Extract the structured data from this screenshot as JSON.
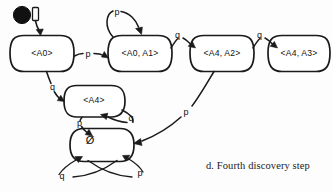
{
  "figure": {
    "caption": "d. Fourth discovery step",
    "kind": "finite-automaton-diagram",
    "background_color": "#fdfdfd",
    "ink_color": "#1a1a1a"
  },
  "states": [
    {
      "id": "a0",
      "label": "<A0>",
      "x": 42,
      "y": 53,
      "rx": 32,
      "ry": 18,
      "initial": true
    },
    {
      "id": "a0a1",
      "label": "<A0, A1>",
      "x": 140,
      "y": 53,
      "rx": 32,
      "ry": 18,
      "initial": false
    },
    {
      "id": "a4a2",
      "label": "<A4, A2>",
      "x": 222,
      "y": 53,
      "rx": 32,
      "ry": 18,
      "initial": false
    },
    {
      "id": "a4a3",
      "label": "<A4, A3>",
      "x": 299,
      "y": 53,
      "rx": 31,
      "ry": 18,
      "initial": false
    },
    {
      "id": "a4",
      "label": "<A4>",
      "x": 94,
      "y": 101,
      "rx": 31,
      "ry": 16,
      "initial": false
    },
    {
      "id": "empty",
      "label": "Ø",
      "x": 102,
      "y": 145,
      "rx": 32,
      "ry": 17,
      "initial": false
    }
  ],
  "transitions": [
    {
      "from": "start",
      "to": "a0",
      "symbol": "",
      "label_x": 0,
      "label_y": 0
    },
    {
      "from": "a0",
      "to": "a0a1",
      "symbol": "p",
      "label_x": 88,
      "label_y": 55
    },
    {
      "from": "a0",
      "to": "a4",
      "symbol": "q",
      "label_x": 52,
      "label_y": 88
    },
    {
      "from": "a0a1",
      "to": "a0a1",
      "symbol": "p",
      "label_x": 116,
      "label_y": 15
    },
    {
      "from": "a0a1",
      "to": "a4a2",
      "symbol": "q",
      "label_x": 177,
      "label_y": 37
    },
    {
      "from": "a4a2",
      "to": "a4a3",
      "symbol": "q",
      "label_x": 259,
      "label_y": 37
    },
    {
      "from": "a4",
      "to": "a4",
      "symbol": "q",
      "label_x": 131,
      "label_y": 118
    },
    {
      "from": "a4",
      "to": "empty",
      "symbol": "p",
      "label_x": 81,
      "label_y": 122
    },
    {
      "from": "a4a2",
      "to": "empty",
      "symbol": "p",
      "label_x": 185,
      "label_y": 114
    },
    {
      "from": "empty",
      "to": "empty",
      "symbol": "q",
      "label_x": 63,
      "label_y": 176
    },
    {
      "from": "empty",
      "to": "empty",
      "symbol": "p",
      "label_x": 141,
      "label_y": 174
    }
  ],
  "start_marker": {
    "name": "initial-state-marker",
    "dot_x": 22,
    "dot_y": 14,
    "dot_r": 8.5,
    "flag_x": 33,
    "flag_y": 8
  }
}
